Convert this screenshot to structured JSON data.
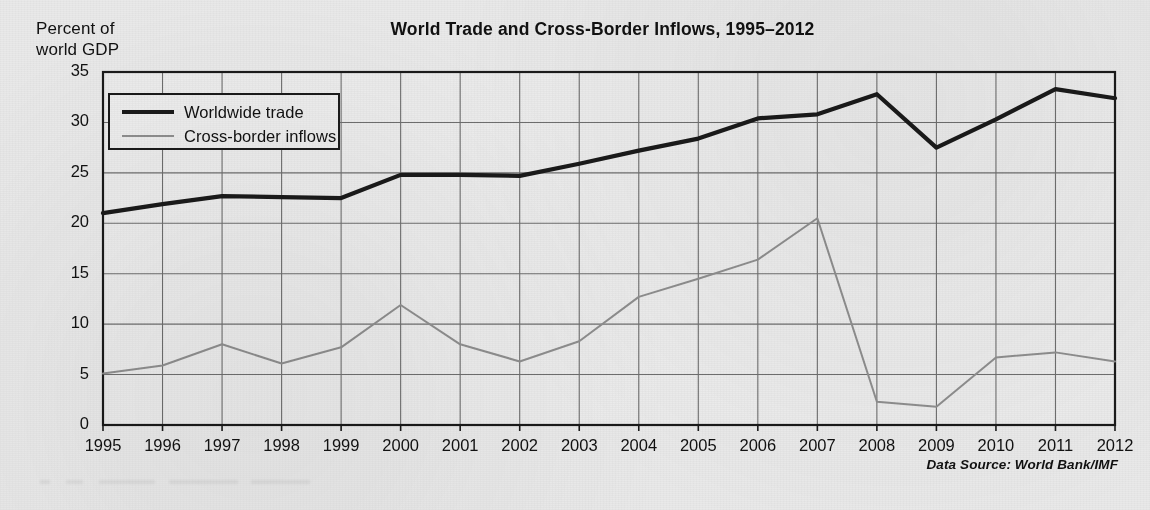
{
  "figure": {
    "title": "World Trade and Cross-Border Inflows, 1995–2012",
    "y_axis_caption_line1": "Percent of",
    "y_axis_caption_line2": "world GDP",
    "source_note": "Data Source: World Bank/IMF",
    "colors": {
      "background": "#e9e9e9",
      "plot_background": "#ebebeb",
      "frame": "#1a1a1a",
      "gridline": "#6e6e6e",
      "series_trade": "#1a1a1a",
      "series_inflows": "#8e8e8e",
      "text": "#111111"
    }
  },
  "legend": {
    "position": "inside-top-left",
    "entries": [
      {
        "label": "Worldwide trade",
        "swatch": "thick-black-line"
      },
      {
        "label": "Cross-border inflows",
        "swatch": "thin-gray-line"
      }
    ]
  },
  "chart_data": {
    "type": "line",
    "title": "World Trade and Cross-Border Inflows, 1995–2012",
    "subtitle": "",
    "xlabel": "",
    "ylabel": "Percent of world GDP",
    "xlim": [
      1995,
      2012
    ],
    "ylim": [
      0,
      35
    ],
    "ytick_step": 5,
    "yticks": [
      0,
      5,
      10,
      15,
      20,
      25,
      30,
      35
    ],
    "ytick_labels": [
      "0",
      "5",
      "10",
      "15",
      "20",
      "25",
      "30",
      "35"
    ],
    "grid": "both",
    "legend_position": "upper left (inside plot)",
    "annotations": [
      "Data Source: World Bank/IMF"
    ],
    "categories": [
      "1995",
      "1996",
      "1997",
      "1998",
      "1999",
      "2000",
      "2001",
      "2002",
      "2003",
      "2004",
      "2005",
      "2006",
      "2007",
      "2008",
      "2009",
      "2010",
      "2011",
      "2012"
    ],
    "x": [
      1995,
      1996,
      1997,
      1998,
      1999,
      2000,
      2001,
      2002,
      2003,
      2004,
      2005,
      2006,
      2007,
      2008,
      2009,
      2010,
      2011,
      2012
    ],
    "series": [
      {
        "name": "Worldwide trade",
        "color": "#1a1a1a",
        "linewidth": "thick",
        "values": [
          21.0,
          21.9,
          22.7,
          22.6,
          22.5,
          24.8,
          24.8,
          24.7,
          25.9,
          27.2,
          28.4,
          30.4,
          30.8,
          32.8,
          27.5,
          30.3,
          33.3,
          32.4
        ]
      },
      {
        "name": "Cross-border inflows",
        "color": "#8e8e8e",
        "linewidth": "thin",
        "values": [
          5.1,
          5.9,
          8.0,
          6.1,
          7.7,
          11.9,
          8.0,
          6.3,
          8.3,
          12.7,
          14.5,
          16.4,
          20.5,
          2.3,
          1.8,
          6.7,
          7.2,
          6.3
        ]
      }
    ]
  }
}
